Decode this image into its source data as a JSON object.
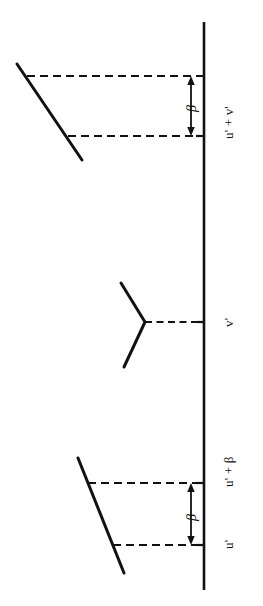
{
  "figure": {
    "title": "",
    "background_color": "#ffffff",
    "ink_color": "#111111",
    "width": 263,
    "height": 606
  },
  "axis": {
    "name": "vertical-axis",
    "orientation": "vertical",
    "x": 204,
    "y_top": 22,
    "y_bottom": 590
  },
  "ticks": [
    {
      "id": "tick-u-prime-plus-v-prime",
      "label": "u' + v'",
      "y": 136,
      "side": "left"
    },
    {
      "id": "tick-v-prime",
      "label": "v'",
      "y": 322,
      "side": "left"
    },
    {
      "id": "tick-u-prime-plus-beta",
      "label": "u' + β",
      "y": 483,
      "side": "left"
    },
    {
      "id": "tick-u-prime",
      "label": "u'",
      "y": 545,
      "side": "left"
    }
  ],
  "interval_labels": [
    {
      "id": "beta-top",
      "label": "β",
      "y_top": 76,
      "y_bottom": 136,
      "x": 191
    },
    {
      "id": "beta-bottom",
      "label": "β",
      "y_top": 483,
      "y_bottom": 545,
      "x": 191
    }
  ],
  "groups": {
    "top": {
      "name": "upper-branch-group",
      "diagonal": {
        "x1": 17,
        "y1": 64,
        "x2": 82,
        "y2": 160
      },
      "dashed_upper": {
        "x1": 27,
        "y1": 76,
        "x2": 204,
        "y2": 76
      },
      "dashed_lower": {
        "x1": 68,
        "y1": 136,
        "x2": 204,
        "y2": 136
      }
    },
    "middle": {
      "name": "vertex-branch-group",
      "upper_arm": {
        "x1": 121,
        "y1": 283,
        "x2": 145,
        "y2": 322
      },
      "lower_arm": {
        "x1": 124,
        "y1": 367,
        "x2": 145,
        "y2": 322
      },
      "dashed_connector": {
        "x1": 145,
        "y1": 322,
        "x2": 204,
        "y2": 322
      }
    },
    "bottom": {
      "name": "lower-branch-group",
      "diagonal": {
        "x1": 78,
        "y1": 458,
        "x2": 124,
        "y2": 573
      },
      "dashed_upper": {
        "x1": 88,
        "y1": 483,
        "x2": 204,
        "y2": 483
      },
      "dashed_lower": {
        "x1": 113,
        "y1": 545,
        "x2": 204,
        "y2": 545
      }
    }
  }
}
